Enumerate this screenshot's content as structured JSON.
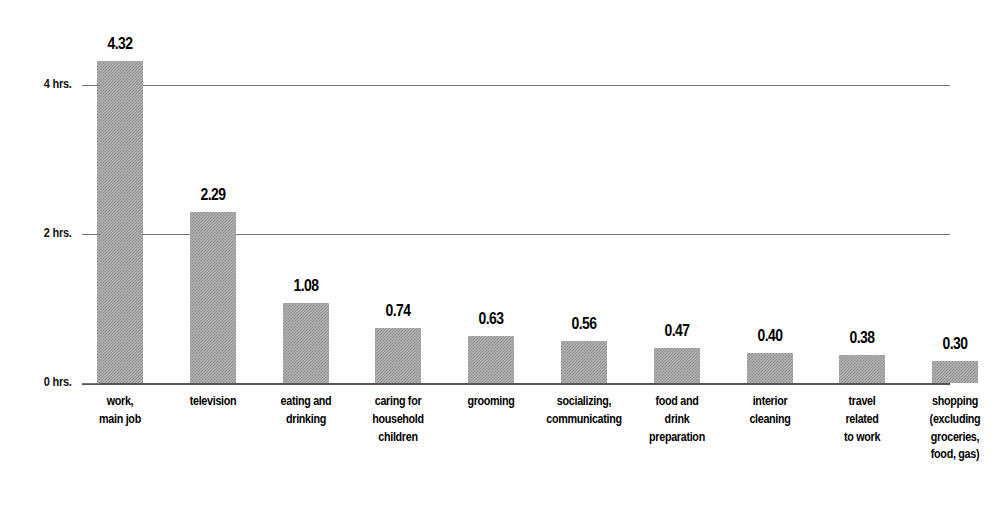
{
  "chart_data": {
    "type": "bar",
    "title": "",
    "subtitle": "",
    "xlabel": "",
    "ylabel": "",
    "grid": true,
    "legend": null,
    "ylim": [
      0,
      4.8
    ],
    "yticks": [
      0,
      2,
      4
    ],
    "ytick_labels": [
      "0 hrs.",
      "2 hrs.",
      "4 hrs."
    ],
    "categories": [
      "work,\nmain job",
      "television",
      "eating and\ndrinking",
      "caring for\nhousehold\nchildren",
      "grooming",
      "socializing,\ncommunicating",
      "food and\ndrink\npreparation",
      "interior\ncleaning",
      "travel\nrelated\nto work",
      "shopping\n(excluding\ngroceries,\nfood, gas)"
    ],
    "values": [
      4.32,
      2.29,
      1.08,
      0.74,
      0.63,
      0.56,
      0.47,
      0.4,
      0.38,
      0.3
    ],
    "value_labels": [
      "4.32",
      "2.29",
      "1.08",
      "0.74",
      "0.63",
      "0.56",
      "0.47",
      "0.40",
      "0.38",
      "0.30"
    ],
    "bar_color": "#a8a8a8",
    "grid_color": "#777777",
    "axis_color": "#555555",
    "background_color": "#ffffff",
    "units": "hours per day"
  }
}
